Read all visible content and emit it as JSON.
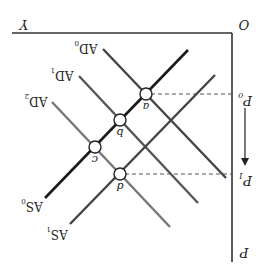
{
  "diagram": {
    "rotation_deg": 180,
    "axes": {
      "origin_label": "O",
      "x_label": "Y",
      "y_label": "P",
      "color": "#333333"
    },
    "price_levels": [
      {
        "id": "P0",
        "label": "P",
        "sub": "0"
      },
      {
        "id": "P1",
        "label": "P",
        "sub": "1"
      }
    ],
    "arrow": {
      "from": "P0",
      "to": "P1",
      "meaning": "price level falls"
    },
    "curves": {
      "AS0": {
        "label": "AS",
        "sub": "0",
        "color": "#1a1a1a"
      },
      "AS1": {
        "label": "AS",
        "sub": "1",
        "color": "#444444"
      },
      "AD0": {
        "label": "AD",
        "sub": "0",
        "color": "#444444"
      },
      "AD1": {
        "label": "AD",
        "sub": "1",
        "color": "#555555"
      },
      "AD2": {
        "label": "AD",
        "sub": "2",
        "color": "#777777"
      }
    },
    "points": [
      {
        "id": "a",
        "label": "a",
        "on": [
          "AS0",
          "AD0"
        ],
        "price": "P0"
      },
      {
        "id": "b",
        "label": "b",
        "on": [
          "AS0",
          "AD1"
        ]
      },
      {
        "id": "c",
        "label": "c",
        "on": [
          "AS0",
          "AD2"
        ]
      },
      {
        "id": "d",
        "label": "d",
        "on": [
          "AS1",
          "AD1"
        ],
        "price": "P1"
      }
    ],
    "guide_lines": {
      "style": "dashed",
      "color": "#555555"
    }
  }
}
